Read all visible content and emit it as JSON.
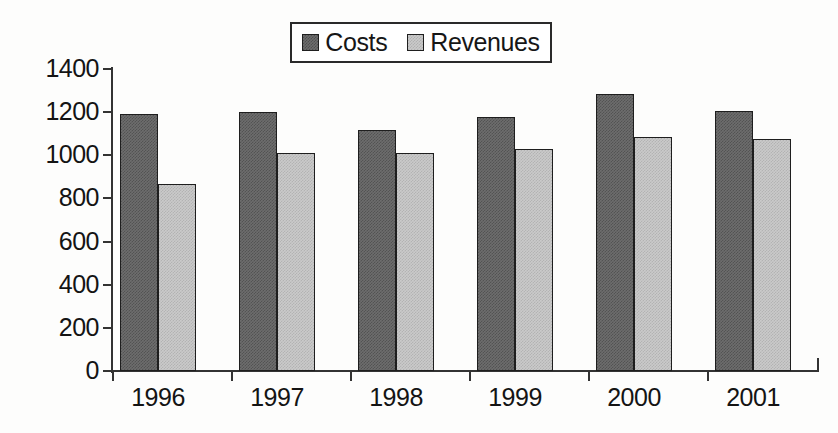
{
  "chart_data": {
    "type": "bar",
    "title": "",
    "subtitle": "",
    "xlabel": "",
    "ylabel": "",
    "categories": [
      "1996",
      "1997",
      "1998",
      "1999",
      "2000",
      "2001"
    ],
    "series": [
      {
        "name": "Costs",
        "color": "#6d6d6d",
        "values": [
          1190,
          1200,
          1115,
          1178,
          1285,
          1205
        ]
      },
      {
        "name": "Revenues",
        "color": "#cacaca",
        "values": [
          865,
          1012,
          1010,
          1030,
          1083,
          1075
        ]
      }
    ],
    "ylim": [
      0,
      1400
    ],
    "ytick_labels": [
      "1400",
      "1200",
      "1000",
      "800",
      "600",
      "400",
      "200",
      "0"
    ],
    "ytick_values": [
      1400,
      1200,
      1000,
      800,
      600,
      400,
      200,
      0
    ],
    "ytick_step": 200,
    "grid": false,
    "legend_position": "top-center",
    "bar_grouping": "grouped",
    "background_color": "#fdfdfc",
    "axis_color": "#333333"
  },
  "legend": {
    "entries": [
      {
        "label": "Costs",
        "swatch": "costs-swatch"
      },
      {
        "label": "Revenues",
        "swatch": "revenues-swatch"
      }
    ]
  }
}
